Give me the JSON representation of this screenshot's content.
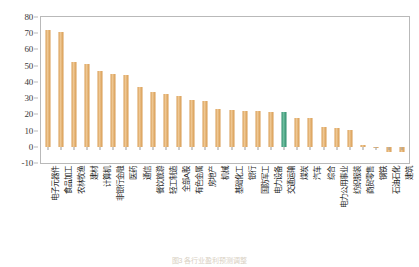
{
  "chart_data": {
    "type": "bar",
    "title": "",
    "xlabel": "",
    "ylabel": "",
    "ylim": [
      -10,
      80
    ],
    "ytick_step": 10,
    "yticks": [
      80,
      70,
      60,
      50,
      40,
      30,
      20,
      10,
      0,
      -10
    ],
    "grid": false,
    "legend": "none",
    "categories": [
      "电子元器件",
      "食品加工",
      "农林牧渔",
      "建材",
      "计算机",
      "非银行金融",
      "医药",
      "通信",
      "餐饮旅游",
      "轻工制造",
      "全部A股",
      "有色金属",
      "房地产",
      "机械",
      "基础化工",
      "银行",
      "国防军工",
      "电力设备",
      "交通运输",
      "煤炭",
      "汽车",
      "综合",
      "电力公用事业",
      "纺织服装",
      "商贸零售",
      "钢铁",
      "石油石化",
      "建筑"
    ],
    "values": [
      72,
      71,
      52,
      51,
      47,
      45,
      44,
      37,
      34,
      32.5,
      31.5,
      29,
      28,
      23,
      22.5,
      22,
      22,
      21.5,
      21.5,
      18,
      17.5,
      12.5,
      11.5,
      10.5,
      1,
      -0.5,
      -3.5,
      -3.5
    ],
    "highlight_index": 18,
    "colors": {
      "bar": "#D79A4F",
      "bar_highlight": "#2E8B6B",
      "axis": "#B9B9B9",
      "text": "#1B1B1B"
    }
  },
  "caption": "图3  各行业盈利预测调整"
}
